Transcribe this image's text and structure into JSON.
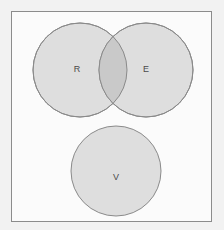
{
  "figure": {
    "type": "venn-diagram",
    "caption": "",
    "background_color": "#f2f2f2",
    "frame": {
      "border_color": "#8c8c8c",
      "fill_color": "#fbfbfb",
      "x": 11,
      "y": 11,
      "width": 201,
      "height": 211
    },
    "style": {
      "circle_fill": "#dedede",
      "circle_stroke": "#8a8a8a",
      "overlap_fill": "#c9c9c9",
      "label_color": "#4a4a4a",
      "stroke_width": 1
    },
    "sets": [
      {
        "id": "set-r",
        "label": "R",
        "cx": 80,
        "cy": 70,
        "r": 47,
        "label_x": 77,
        "label_y": 70
      },
      {
        "id": "set-e",
        "label": "E",
        "cx": 146,
        "cy": 70,
        "r": 47,
        "label_x": 146,
        "label_y": 70
      },
      {
        "id": "set-v",
        "label": "V",
        "cx": 116,
        "cy": 171,
        "r": 45,
        "label_x": 116,
        "label_y": 178
      }
    ],
    "intersections": [
      {
        "id": "intersection-r-e",
        "between": [
          "R",
          "E"
        ],
        "label": "",
        "overlapping": true
      },
      {
        "id": "intersection-r-v",
        "between": [
          "R",
          "V"
        ],
        "label": "",
        "overlapping": false
      },
      {
        "id": "intersection-e-v",
        "between": [
          "E",
          "V"
        ],
        "label": "",
        "overlapping": false
      }
    ]
  }
}
